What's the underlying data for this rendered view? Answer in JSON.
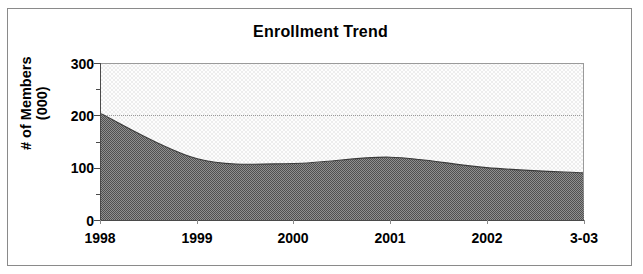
{
  "chart_data": {
    "type": "area",
    "title": "Enrollment Trend",
    "xlabel": "",
    "ylabel": "# of Members (000)",
    "ylabel_line1": "# of Members",
    "ylabel_line2": "(000)",
    "categories": [
      "1998",
      "1999",
      "2000",
      "2001",
      "2002",
      "3-03"
    ],
    "values": [
      203,
      117,
      108,
      120,
      100,
      90
    ],
    "series": [
      {
        "name": "# of Members (000)",
        "values": [
          203,
          117,
          108,
          120,
          100,
          90
        ]
      }
    ],
    "ylim": [
      0,
      300
    ],
    "y_ticks": [
      0,
      100,
      200,
      300
    ],
    "y_tick_labels": [
      "0",
      "100",
      "200",
      "300"
    ],
    "y_minor_ticks": [
      50,
      150,
      250
    ],
    "x_tick_labels": [
      "1998",
      "1999",
      "2000",
      "2001",
      "2002",
      "3-03"
    ],
    "gridlines": [
      200
    ],
    "grid": "horizontal-dotted-at-200",
    "legend": "none",
    "legend_position": "none",
    "colors": {
      "area_fill": "#6e6e6e",
      "area_line": "#3a3a3a",
      "plot_background": "#f2f2f2",
      "axis": "#4a4a4a",
      "gridline": "#9a9a9a",
      "text": "#000000",
      "frame_border": "#8a8a8a"
    }
  }
}
